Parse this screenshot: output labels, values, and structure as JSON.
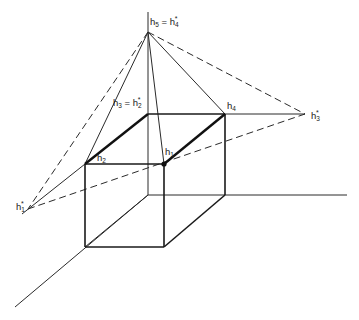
{
  "figure": {
    "colors": {
      "ink": "#1a1a1a",
      "background": "#ffffff"
    }
  },
  "labels": {
    "h5_eq_h4star": {
      "base": "h",
      "sub": "5",
      "eq": " = ",
      "base2": "h",
      "sub2": "4",
      "sup2": "*"
    },
    "h3_eq_h2star": {
      "base": "h",
      "sub": "3",
      "eq": " = ",
      "base2": "h",
      "sub2": "2",
      "sup2": "*"
    },
    "h4": {
      "base": "h",
      "sub": "4"
    },
    "h3star": {
      "base": "h",
      "sub": "3",
      "sup": "*"
    },
    "h2": {
      "base": "h",
      "sub": "2"
    },
    "h1": {
      "base": "h",
      "sub": "1"
    },
    "h1star": {
      "base": "h",
      "sub": "1",
      "sup": "*"
    }
  },
  "points": {
    "h5": [
      148,
      32
    ],
    "h3": [
      148,
      114
    ],
    "h4": [
      225,
      114
    ],
    "h2": [
      85,
      164
    ],
    "h1": [
      164,
      164
    ],
    "h3star": [
      305,
      114
    ],
    "h1star": [
      28,
      209
    ],
    "origin": [
      148,
      195
    ]
  }
}
